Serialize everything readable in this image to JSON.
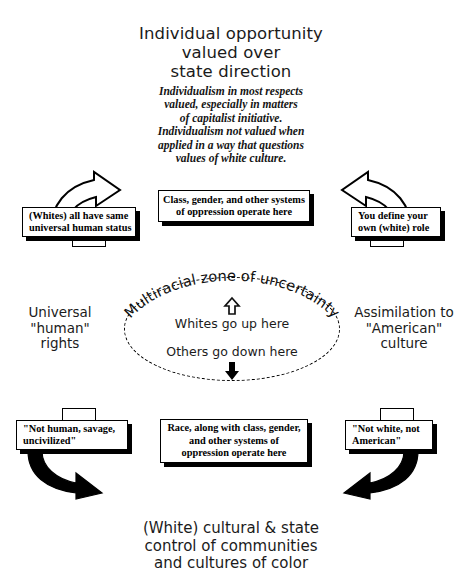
{
  "diagram": {
    "title_top": {
      "lines": [
        "Individual opportunity",
        "valued over",
        "state direction"
      ]
    },
    "blurb_top": {
      "lines": [
        "Individualism in most respects",
        "valued, especially in matters",
        "of capitalist initiative.",
        "Individualism not valued when",
        "applied in a way that questions",
        "values of white culture."
      ]
    },
    "caption_bottom": {
      "lines": [
        "(White) cultural & state",
        "control of communities",
        "and cultures of color"
      ]
    },
    "side_left": {
      "lines": [
        "Universal",
        "\"human\"",
        "rights"
      ]
    },
    "side_right": {
      "lines": [
        "Assimilation to",
        "\"American\"",
        "culture"
      ]
    },
    "boxes": {
      "top_left": {
        "lines": [
          "(Whites) all have same",
          "universal human status"
        ]
      },
      "top_center": {
        "lines": [
          "Class, gender, and other systems",
          "of  oppression operate here"
        ]
      },
      "top_right": {
        "lines": [
          "You define your",
          "own (white) role"
        ]
      },
      "bottom_left": {
        "lines": [
          "\"Not human, savage,",
          "uncivilized\""
        ]
      },
      "bottom_center": {
        "lines": [
          "Race, along with class, gender,",
          "and other systems of",
          "oppression operate here"
        ]
      },
      "bottom_right": {
        "lines": [
          "\"Not white, not",
          "American\""
        ]
      }
    },
    "zone": {
      "arc_label": "Multiracial zone of uncertainty",
      "up_label": "Whites go up here",
      "down_label": "Others go down here",
      "up_arrow_glyph": "⇧",
      "down_arrow_glyph": "⬇"
    },
    "colors": {
      "ink": "#000000",
      "text": "#1b1b1b",
      "background": "#ffffff",
      "shadow": "#000000"
    }
  }
}
